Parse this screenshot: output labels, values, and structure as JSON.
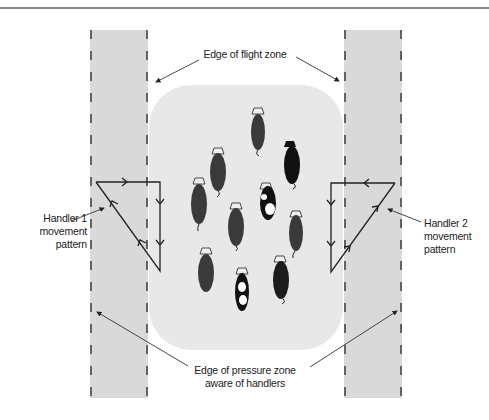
{
  "figure": {
    "labels": {
      "flight_zone_edge": "Edge of flight zone",
      "handler1": [
        "Handler 1",
        "movement",
        "pattern"
      ],
      "handler2": [
        "Handler 2",
        "movement",
        "pattern"
      ],
      "pressure_zone_edge": [
        "Edge of pressure zone",
        "aware of handlers"
      ]
    },
    "colors": {
      "pressure_band": "#d6d6d6",
      "flight_zone": "#e6e6e6",
      "dash": "#555555",
      "line": "#222222",
      "cow_dark": "#3a3a3a",
      "cow_black": "#111111"
    },
    "cow_count": 11
  }
}
